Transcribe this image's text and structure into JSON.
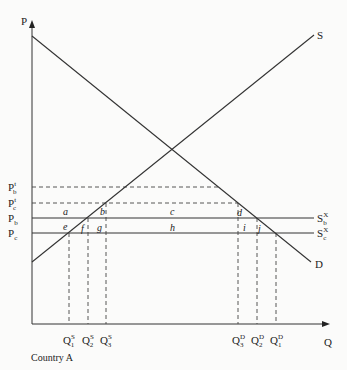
{
  "diagram": {
    "axes": {
      "y_label": "P",
      "x_label": "Q",
      "caption": "Country A"
    },
    "curves": {
      "supply_label": "S",
      "demand_label": "D"
    },
    "price_levels": [
      {
        "id": "pbt",
        "base": "P",
        "sub": "b",
        "sup": "t",
        "y": 187,
        "style": "dashed"
      },
      {
        "id": "pct",
        "base": "P",
        "sub": "c",
        "sup": "t",
        "y": 203,
        "style": "dashed"
      },
      {
        "id": "pb",
        "base": "P",
        "sub": "b",
        "sup": "",
        "y": 218,
        "style": "solid"
      },
      {
        "id": "pc",
        "base": "P",
        "sub": "c",
        "sup": "",
        "y": 233,
        "style": "solid"
      }
    ],
    "world_supply_labels": [
      {
        "id": "sbx",
        "base": "S",
        "sub": "b",
        "sup": "X"
      },
      {
        "id": "scx",
        "base": "S",
        "sub": "c",
        "sup": "X"
      }
    ],
    "quantity_labels": [
      {
        "id": "q1s",
        "base": "Q",
        "sub": "1",
        "sup": "S",
        "x": 69
      },
      {
        "id": "q2s",
        "base": "Q",
        "sub": "2",
        "sup": "S",
        "x": 88
      },
      {
        "id": "q3s",
        "base": "Q",
        "sub": "3",
        "sup": "S",
        "x": 106
      },
      {
        "id": "q3d",
        "base": "Q",
        "sub": "3",
        "sup": "D",
        "x": 238
      },
      {
        "id": "q2d",
        "base": "Q",
        "sub": "2",
        "sup": "D",
        "x": 257
      },
      {
        "id": "q1d",
        "base": "Q",
        "sub": "1",
        "sup": "D",
        "x": 276
      }
    ],
    "area_labels": {
      "a": "a",
      "b": "b",
      "c": "c",
      "d": "d",
      "e": "e",
      "f": "f",
      "g": "g",
      "h": "h",
      "i": "i",
      "j": "j"
    }
  }
}
